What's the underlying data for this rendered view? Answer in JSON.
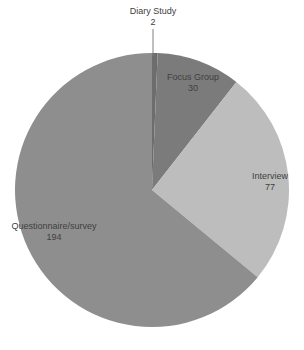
{
  "chart_data": {
    "type": "pie",
    "title": "",
    "categories": [
      "Diary Study",
      "Focus Group",
      "Interview",
      "Questionnaire/survey"
    ],
    "values": [
      2,
      30,
      77,
      194
    ],
    "colors": [
      "#6d6d6d",
      "#7b7b7b",
      "#bdbdbd",
      "#8e8e8e"
    ],
    "start_angle_deg": 0,
    "direction": "clockwise",
    "legend": "none",
    "data_labels": [
      {
        "name": "Diary Study",
        "value": "2"
      },
      {
        "name": "Focus Group",
        "value": "30"
      },
      {
        "name": "Interview",
        "value": "77"
      },
      {
        "name": "Questionnaire/survey",
        "value": "194"
      }
    ]
  }
}
